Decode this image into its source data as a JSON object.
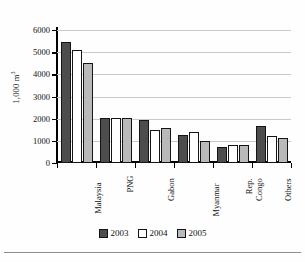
{
  "chart_data": {
    "type": "bar",
    "title": "",
    "subtitle": "",
    "xlabel": "",
    "ylabel": "1,000 m³",
    "ylabel_base": "1,000 m",
    "ylabel_sup": "3",
    "ylim": [
      0,
      6000
    ],
    "yticks": [
      0,
      1000,
      2000,
      3000,
      4000,
      5000,
      6000
    ],
    "ytick_labels": [
      "0",
      "1000",
      "2000",
      "3000",
      "4000",
      "5000",
      "6000"
    ],
    "grid": true,
    "grid_axis": "y",
    "legend_position": "bottom-center",
    "orientation": "vertical",
    "grouping": "clustered",
    "categories": [
      "Malaysia",
      "PNG",
      "Gabon",
      "Myanmar",
      "Rep. Congo",
      "Others"
    ],
    "category_lines": [
      [
        "Malaysia"
      ],
      [
        "PNG"
      ],
      [
        "Gabon"
      ],
      [
        "Myanmar"
      ],
      [
        "Rep.",
        "Congo"
      ],
      [
        "Others"
      ]
    ],
    "series": [
      {
        "name": "2003",
        "color": "#4d4d4d",
        "values": [
          5450,
          2010,
          1930,
          1270,
          730,
          1690
        ]
      },
      {
        "name": "2004",
        "color": "#ffffff",
        "values": [
          5100,
          2010,
          1500,
          1380,
          830,
          1220
        ]
      },
      {
        "name": "2005",
        "color": "#b9b9b9",
        "values": [
          4490,
          2010,
          1600,
          1010,
          820,
          1110
        ]
      }
    ]
  },
  "legend": {
    "items": [
      {
        "label": "2003",
        "swatch": "s2003"
      },
      {
        "label": "2004",
        "swatch": "s2004"
      },
      {
        "label": "2005",
        "swatch": "s2005"
      }
    ]
  },
  "colors": {
    "series_2003": "#4d4d4d",
    "series_2004": "#ffffff",
    "series_2005": "#b9b9b9",
    "axis": "#000000",
    "gridline": "#c9c9c9",
    "text": "#111111",
    "background": "#fefefe"
  }
}
